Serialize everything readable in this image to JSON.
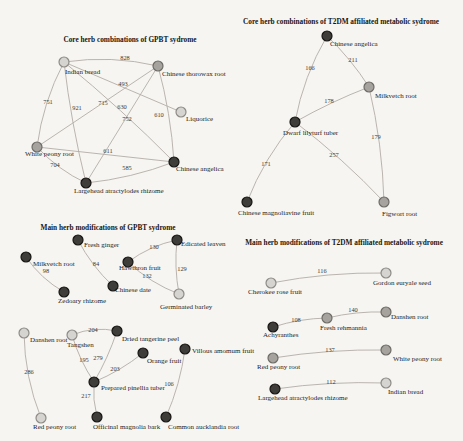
{
  "figure": {
    "width": 463,
    "height": 441,
    "background": "#f6f5f2",
    "node_radius": 5,
    "palette": {
      "edge": "#b3ada6",
      "edge_label": "#3d3a36",
      "node_label": "#221f1c",
      "title": "#171513",
      "node_colors": {
        "light": {
          "fill": "#d6d4d0",
          "stroke": "#8e8b86"
        },
        "medium": {
          "fill": "#a6a39e",
          "stroke": "#6e6b66"
        },
        "dark": {
          "fill": "#3f3d3a",
          "stroke": "#171513"
        }
      }
    },
    "panels": [
      {
        "id": "core-gpbt",
        "title": "Core herb combinations of GPBT sydrome",
        "title_x": 130,
        "title_y": 42,
        "nodes": [
          {
            "id": "indian-bread",
            "label": "Indian bread",
            "x": 64,
            "y": 62,
            "tone": "light",
            "lx": 65,
            "ly": 74,
            "anchor": "start"
          },
          {
            "id": "chinese-thorowax-root",
            "label": "Chinese thorowax root",
            "x": 158,
            "y": 66,
            "tone": "medium",
            "lx": 162,
            "ly": 76,
            "anchor": "start"
          },
          {
            "id": "liquorice",
            "label": "Liquorice",
            "x": 181,
            "y": 112,
            "tone": "light",
            "lx": 186,
            "ly": 121,
            "anchor": "start"
          },
          {
            "id": "white-peony-root",
            "label": "White peony root",
            "x": 37,
            "y": 147,
            "tone": "medium",
            "lx": 25,
            "ly": 156,
            "anchor": "start"
          },
          {
            "id": "chinese-angelica",
            "label": "Chinese angelica",
            "x": 174,
            "y": 162,
            "tone": "dark",
            "lx": 176,
            "ly": 171,
            "anchor": "start"
          },
          {
            "id": "largehead-atractylodes-rhizome",
            "label": "Largehead atractylodes rhizome",
            "x": 86,
            "y": 183,
            "tone": "dark",
            "lx": 74,
            "ly": 193,
            "anchor": "start"
          }
        ],
        "edges": [
          {
            "source": "indian-bread",
            "target": "chinese-thorowax-root",
            "weight": "828",
            "curve": -9,
            "lx": 125,
            "ly": 60
          },
          {
            "source": "indian-bread",
            "target": "white-peony-root",
            "weight": "751",
            "curve": 8,
            "lx": 48,
            "ly": 104
          },
          {
            "source": "indian-bread",
            "target": "largehead-atractylodes-rhizome",
            "weight": "921",
            "curve": 4,
            "lx": 77,
            "ly": 110
          },
          {
            "source": "indian-bread",
            "target": "liquorice",
            "weight": "493",
            "curve": 0,
            "lx": 123,
            "ly": 86
          },
          {
            "source": "indian-bread",
            "target": "chinese-angelica",
            "weight": "630",
            "curve": -4,
            "lx": 122,
            "ly": 109
          },
          {
            "source": "chinese-thorowax-root",
            "target": "white-peony-root",
            "weight": "715",
            "curve": 0,
            "lx": 103,
            "ly": 105
          },
          {
            "source": "chinese-thorowax-root",
            "target": "largehead-atractylodes-rhizome",
            "weight": "752",
            "curve": 0,
            "lx": 127,
            "ly": 121
          },
          {
            "source": "chinese-thorowax-root",
            "target": "chinese-angelica",
            "weight": "610",
            "curve": -5,
            "lx": 159,
            "ly": 117
          },
          {
            "source": "white-peony-root",
            "target": "chinese-angelica",
            "weight": "611",
            "curve": 0,
            "lx": 108,
            "ly": 153
          },
          {
            "source": "white-peony-root",
            "target": "largehead-atractylodes-rhizome",
            "weight": "704",
            "curve": 6,
            "lx": 55,
            "ly": 167
          },
          {
            "source": "largehead-atractylodes-rhizome",
            "target": "chinese-angelica",
            "weight": "585",
            "curve": 6,
            "lx": 127,
            "ly": 170
          }
        ]
      },
      {
        "id": "core-t2dm",
        "title": "Core herb combinations of T2DM affiliated metabolic sydrome",
        "title_x": 341,
        "title_y": 24,
        "nodes": [
          {
            "id": "chinese-angelica",
            "label": "Chinese angelica",
            "x": 327,
            "y": 36,
            "tone": "dark",
            "lx": 330,
            "ly": 46,
            "anchor": "start"
          },
          {
            "id": "milkvetch-root",
            "label": "Milkvetch root",
            "x": 369,
            "y": 87,
            "tone": "medium",
            "lx": 375,
            "ly": 98,
            "anchor": "start"
          },
          {
            "id": "dwarf-lilyturf-tuber",
            "label": "Dwarf lilyturf tuber",
            "x": 295,
            "y": 122,
            "tone": "dark",
            "lx": 283,
            "ly": 135,
            "anchor": "start"
          },
          {
            "id": "chinese-magnoliavine-fruit",
            "label": "Chinese magnoliavine fruit",
            "x": 247,
            "y": 202,
            "tone": "dark",
            "lx": 238,
            "ly": 215,
            "anchor": "start"
          },
          {
            "id": "figwort-root",
            "label": "Figwort root",
            "x": 384,
            "y": 202,
            "tone": "medium",
            "lx": 382,
            "ly": 216,
            "anchor": "start"
          }
        ],
        "edges": [
          {
            "source": "chinese-angelica",
            "target": "dwarf-lilyturf-tuber",
            "weight": "166",
            "curve": 8,
            "lx": 310,
            "ly": 70
          },
          {
            "source": "chinese-angelica",
            "target": "milkvetch-root",
            "weight": "211",
            "curve": -4,
            "lx": 353,
            "ly": 62
          },
          {
            "source": "dwarf-lilyturf-tuber",
            "target": "milkvetch-root",
            "weight": "178",
            "curve": -3,
            "lx": 329,
            "ly": 103
          },
          {
            "source": "milkvetch-root",
            "target": "figwort-root",
            "weight": "179",
            "curve": -6,
            "lx": 376,
            "ly": 139
          },
          {
            "source": "dwarf-lilyturf-tuber",
            "target": "figwort-root",
            "weight": "257",
            "curve": -5,
            "lx": 334,
            "ly": 157
          },
          {
            "source": "dwarf-lilyturf-tuber",
            "target": "chinese-magnoliavine-fruit",
            "weight": "171",
            "curve": 8,
            "lx": 266,
            "ly": 166
          }
        ]
      },
      {
        "id": "main-gpbt",
        "title": "Main herb modifications of GPBT sydrome",
        "title_x": 108,
        "title_y": 230,
        "nodes": [
          {
            "id": "milkvetch-root",
            "label": "Milkvetch root",
            "x": 26,
            "y": 257,
            "tone": "dark",
            "lx": 33,
            "ly": 266,
            "anchor": "start"
          },
          {
            "id": "zedoary-rhizome",
            "label": "Zedoary rhizome",
            "x": 64,
            "y": 292,
            "tone": "dark",
            "lx": 58,
            "ly": 303,
            "anchor": "start"
          },
          {
            "id": "fresh-ginger",
            "label": "Fresh ginger",
            "x": 78,
            "y": 240,
            "tone": "dark",
            "lx": 84,
            "ly": 247,
            "anchor": "start"
          },
          {
            "id": "chinese-date",
            "label": "Chinese date",
            "x": 113,
            "y": 286,
            "tone": "dark",
            "lx": 115,
            "ly": 292,
            "anchor": "start"
          },
          {
            "id": "hawthron-fruit",
            "label": "Hawthron fruit",
            "x": 128,
            "y": 262,
            "tone": "dark",
            "lx": 119,
            "ly": 270,
            "anchor": "start"
          },
          {
            "id": "edicated-leaven",
            "label": "Edicated leaven",
            "x": 177,
            "y": 240,
            "tone": "dark",
            "lx": 181,
            "ly": 246,
            "anchor": "start"
          },
          {
            "id": "germinated-barley",
            "label": "Germinated barley",
            "x": 179,
            "y": 294,
            "tone": "light",
            "lx": 160,
            "ly": 309,
            "anchor": "start"
          },
          {
            "id": "danshen-root",
            "label": "Danshen root",
            "x": 24,
            "y": 333,
            "tone": "light",
            "lx": 30,
            "ly": 342,
            "anchor": "start"
          },
          {
            "id": "tangshen",
            "label": "Tangshen",
            "x": 72,
            "y": 335,
            "tone": "light",
            "lx": 67,
            "ly": 347,
            "anchor": "start"
          },
          {
            "id": "dried-tangerine-peel",
            "label": "Dried tangerine peel",
            "x": 117,
            "y": 331,
            "tone": "dark",
            "lx": 122,
            "ly": 341,
            "anchor": "start"
          },
          {
            "id": "orange-fruit",
            "label": "Orange fruit",
            "x": 143,
            "y": 353,
            "tone": "dark",
            "lx": 147,
            "ly": 363,
            "anchor": "start"
          },
          {
            "id": "prepared-pinellia-tuber",
            "label": "Prepared pinellia tuber",
            "x": 94,
            "y": 382,
            "tone": "dark",
            "lx": 101,
            "ly": 390,
            "anchor": "start"
          },
          {
            "id": "officinal-magnolia-bark",
            "label": "Officinal magnolia bark",
            "x": 97,
            "y": 417,
            "tone": "dark",
            "lx": 93,
            "ly": 429,
            "anchor": "start"
          },
          {
            "id": "red-peony-root",
            "label": "Red peony root",
            "x": 41,
            "y": 418,
            "tone": "light",
            "lx": 33,
            "ly": 429,
            "anchor": "start"
          },
          {
            "id": "villous-amomum-fruit",
            "label": "Villous amomum fruit",
            "x": 185,
            "y": 349,
            "tone": "dark",
            "lx": 192,
            "ly": 353,
            "anchor": "start"
          },
          {
            "id": "common-aucklandia-root",
            "label": "Common aucklandia root",
            "x": 166,
            "y": 417,
            "tone": "dark",
            "lx": 168,
            "ly": 429,
            "anchor": "start"
          }
        ],
        "edges": [
          {
            "source": "milkvetch-root",
            "target": "zedoary-rhizome",
            "weight": "98",
            "curve": 6,
            "lx": 46,
            "ly": 273
          },
          {
            "source": "fresh-ginger",
            "target": "chinese-date",
            "weight": "84",
            "curve": 5,
            "lx": 96,
            "ly": 266
          },
          {
            "source": "hawthron-fruit",
            "target": "edicated-leaven",
            "weight": "130",
            "curve": -6,
            "lx": 154,
            "ly": 249
          },
          {
            "source": "edicated-leaven",
            "target": "germinated-barley",
            "weight": "129",
            "curve": 4,
            "lx": 182,
            "ly": 271
          },
          {
            "source": "hawthron-fruit",
            "target": "germinated-barley",
            "weight": "132",
            "curve": 6,
            "lx": 147,
            "ly": 278
          },
          {
            "source": "danshen-root",
            "target": "red-peony-root",
            "weight": "286",
            "curve": 8,
            "lx": 29,
            "ly": 374
          },
          {
            "source": "tangshen",
            "target": "dried-tangerine-peel",
            "weight": "204",
            "curve": -7,
            "lx": 93,
            "ly": 332
          },
          {
            "source": "tangshen",
            "target": "prepared-pinellia-tuber",
            "weight": "195",
            "curve": 4,
            "lx": 84,
            "ly": 362
          },
          {
            "source": "dried-tangerine-peel",
            "target": "prepared-pinellia-tuber",
            "weight": "279",
            "curve": -3,
            "lx": 98,
            "ly": 360
          },
          {
            "source": "orange-fruit",
            "target": "prepared-pinellia-tuber",
            "weight": "203",
            "curve": -4,
            "lx": 115,
            "ly": 371
          },
          {
            "source": "prepared-pinellia-tuber",
            "target": "officinal-magnolia-bark",
            "weight": "217",
            "curve": 3,
            "lx": 86,
            "ly": 398
          },
          {
            "source": "villous-amomum-fruit",
            "target": "common-aucklandia-root",
            "weight": "106",
            "curve": -5,
            "lx": 169,
            "ly": 386
          }
        ]
      },
      {
        "id": "main-t2dm",
        "title": "Main herb modifications of T2DM affiliated metabolic sydrome",
        "title_x": 344,
        "title_y": 245,
        "nodes": [
          {
            "id": "cherokee-rose-fruit",
            "label": "Cherokee rose fruit",
            "x": 271,
            "y": 283,
            "tone": "light",
            "lx": 248,
            "ly": 294,
            "anchor": "start"
          },
          {
            "id": "gordon-euryale-seed",
            "label": "Gordon euryale seed",
            "x": 386,
            "y": 273,
            "tone": "light",
            "lx": 373,
            "ly": 285,
            "anchor": "start"
          },
          {
            "id": "achyranthes",
            "label": "Achyranthes",
            "x": 273,
            "y": 327,
            "tone": "dark",
            "lx": 263,
            "ly": 337,
            "anchor": "start"
          },
          {
            "id": "fresh-rehmannia",
            "label": "Fresh rehmannia",
            "x": 327,
            "y": 318,
            "tone": "medium",
            "lx": 320,
            "ly": 330,
            "anchor": "start"
          },
          {
            "id": "danshen-root",
            "label": "Danshen root",
            "x": 386,
            "y": 312,
            "tone": "medium",
            "lx": 391,
            "ly": 319,
            "anchor": "start"
          },
          {
            "id": "red-peony-root",
            "label": "Red peony root",
            "x": 273,
            "y": 358,
            "tone": "medium",
            "lx": 257,
            "ly": 369,
            "anchor": "start"
          },
          {
            "id": "white-peony-root",
            "label": "White peony root",
            "x": 386,
            "y": 350,
            "tone": "medium",
            "lx": 393,
            "ly": 361,
            "anchor": "start"
          },
          {
            "id": "largehead-atractylodes-rhizome",
            "label": "Largehead atractylodes rhizome",
            "x": 275,
            "y": 389,
            "tone": "dark",
            "lx": 258,
            "ly": 400,
            "anchor": "start"
          },
          {
            "id": "indian-bread",
            "label": "Indian bread",
            "x": 386,
            "y": 383,
            "tone": "light",
            "lx": 388,
            "ly": 394,
            "anchor": "start"
          }
        ],
        "edges": [
          {
            "source": "cherokee-rose-fruit",
            "target": "gordon-euryale-seed",
            "weight": "116",
            "curve": -6,
            "lx": 322,
            "ly": 273
          },
          {
            "source": "achyranthes",
            "target": "fresh-rehmannia",
            "weight": "108",
            "curve": -4,
            "lx": 296,
            "ly": 322
          },
          {
            "source": "fresh-rehmannia",
            "target": "danshen-root",
            "weight": "140",
            "curve": -4,
            "lx": 353,
            "ly": 312
          },
          {
            "source": "red-peony-root",
            "target": "white-peony-root",
            "weight": "137",
            "curve": -5,
            "lx": 330,
            "ly": 352
          },
          {
            "source": "largehead-atractylodes-rhizome",
            "target": "indian-bread",
            "weight": "112",
            "curve": -5,
            "lx": 331,
            "ly": 384
          }
        ]
      }
    ]
  }
}
